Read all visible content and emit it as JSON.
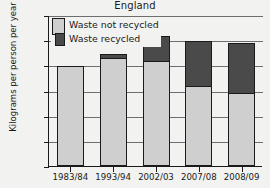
{
  "chart_data": {
    "type": "bar",
    "stacked": true,
    "title": "England",
    "xlabel": "",
    "ylabel": "Kilograms per person per year",
    "categories": [
      "1983/84",
      "1993/94",
      "2002/03",
      "2007/08",
      "2008/09"
    ],
    "ylim": [
      0,
      600
    ],
    "yticks": [
      0,
      100,
      200,
      300,
      400,
      500,
      600
    ],
    "grid": true,
    "legend_position": "top-left-inside",
    "series": [
      {
        "name": "Waste not recycled",
        "color": "#cfcfcf",
        "values": [
          398,
          432,
          420,
          318,
          292
        ]
      },
      {
        "name": "Waste recycled",
        "color": "#4a4a4a",
        "values": [
          0,
          15,
          95,
          177,
          196
        ]
      }
    ],
    "totals": [
      398,
      447,
      515,
      495,
      488
    ]
  },
  "chart": {
    "title": "England",
    "y_axis": {
      "label": "Kilograms per person per year",
      "ticks": [
        "0",
        "100",
        "200",
        "300",
        "400",
        "500",
        "600"
      ]
    },
    "x_axis": {
      "ticks": [
        "1983/84",
        "1993/94",
        "2002/03",
        "2007/08",
        "2008/09"
      ]
    },
    "legend": {
      "items": [
        {
          "label": "Waste not recycled",
          "swatch": "light-gray-swatch"
        },
        {
          "label": "Waste recycled",
          "swatch": "dark-gray-swatch"
        }
      ]
    },
    "colors": {
      "not_recycled": "#cfcfcf",
      "recycled": "#4a4a4a",
      "axis": "#1a1a1a",
      "grid": "#6e6e6e",
      "background": "#f2f2f0"
    }
  }
}
